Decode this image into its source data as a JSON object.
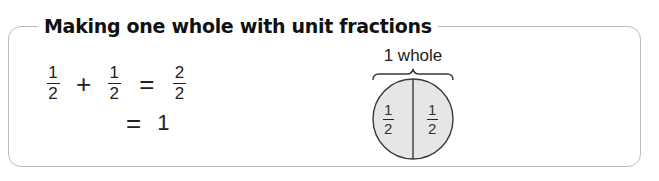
{
  "title": "Making one whole with unit fractions",
  "equation": {
    "line1": {
      "term1": {
        "numerator": "1",
        "denominator": "2"
      },
      "operator1": "+",
      "term2": {
        "numerator": "1",
        "denominator": "2"
      },
      "operator2": "=",
      "result": {
        "numerator": "2",
        "denominator": "2"
      }
    },
    "line2": {
      "operator": "=",
      "result": "1"
    }
  },
  "diagram": {
    "label": "1 whole",
    "left_half": {
      "numerator": "1",
      "denominator": "2"
    },
    "right_half": {
      "numerator": "1",
      "denominator": "2"
    },
    "fill_color": "#e6e6e6",
    "stroke_color": "#3a3a3a"
  },
  "colors": {
    "border": "#bdbdbd",
    "text": "#1a1a1a"
  }
}
